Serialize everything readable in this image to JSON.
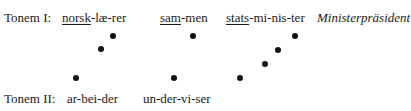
{
  "row1": {
    "label": "Tonem I:",
    "words": [
      {
        "underlined": "norsk",
        "rest": "-læ-rer"
      },
      {
        "underlined": "sam",
        "rest": "-men"
      },
      {
        "underlined": "stats",
        "rest": "-mi-nis-ter"
      }
    ],
    "gloss": "Ministerpräsident"
  },
  "row2": {
    "label": "Tonem II:",
    "words": [
      "ar-bei-der",
      "un-der-vi-ser"
    ]
  },
  "dots": [
    {
      "x": 76,
      "y": 78
    },
    {
      "x": 101,
      "y": 49
    },
    {
      "x": 113,
      "y": 36
    },
    {
      "x": 174,
      "y": 78
    },
    {
      "x": 193,
      "y": 36
    },
    {
      "x": 240,
      "y": 78
    },
    {
      "x": 265,
      "y": 64
    },
    {
      "x": 278,
      "y": 50
    },
    {
      "x": 295,
      "y": 36
    }
  ]
}
